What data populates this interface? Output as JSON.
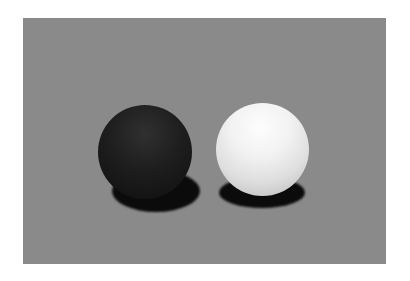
{
  "scene": {
    "background_color": "#ffffff",
    "panel_color": "#8a8a8a",
    "objects": [
      {
        "name": "black-sphere",
        "color": "#1a1a1a"
      },
      {
        "name": "white-sphere",
        "color": "#ececec"
      }
    ]
  }
}
